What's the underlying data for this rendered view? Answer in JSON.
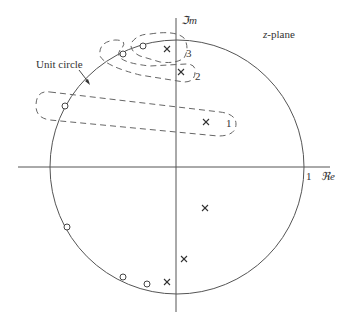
{
  "diagram": {
    "plane_label": "z-plane",
    "plane_label_var": "z",
    "plane_label_suffix": "-plane",
    "imag_axis_label": "ℑm",
    "real_axis_label": "ℜe",
    "unit_tick_label": "1",
    "unit_circle_label": "Unit circle",
    "colors": {
      "line": "#555555",
      "text": "#333333",
      "background": "#ffffff"
    },
    "unit_circle": {
      "cx": 177,
      "cy": 167,
      "r": 127
    },
    "axes": {
      "real": {
        "x1": 18,
        "x2": 330,
        "y": 167
      },
      "imag": {
        "x": 176,
        "y1": 18,
        "y2": 312
      }
    },
    "poles": [
      {
        "id": "p1",
        "x": 206,
        "y": 122,
        "label": "1"
      },
      {
        "id": "p2",
        "x": 181,
        "y": 72,
        "label": "2"
      },
      {
        "id": "p3",
        "x": 167,
        "y": 49,
        "label": "3"
      },
      {
        "id": "p1c",
        "x": 205,
        "y": 208
      },
      {
        "id": "p2c",
        "x": 184,
        "y": 259
      },
      {
        "id": "p3c",
        "x": 167,
        "y": 282
      }
    ],
    "zeros": [
      {
        "id": "z1",
        "x": 65,
        "y": 106
      },
      {
        "id": "z2",
        "x": 123,
        "y": 54
      },
      {
        "id": "z3",
        "x": 143,
        "y": 46
      },
      {
        "id": "z1c",
        "x": 67,
        "y": 227
      },
      {
        "id": "z2c",
        "x": 123,
        "y": 277
      },
      {
        "id": "z3c",
        "x": 147,
        "y": 284
      }
    ],
    "contour_labels": [
      {
        "text": "1",
        "x": 226,
        "y": 127
      },
      {
        "text": "2",
        "x": 195,
        "y": 80
      },
      {
        "text": "3",
        "x": 186,
        "y": 57
      }
    ]
  }
}
